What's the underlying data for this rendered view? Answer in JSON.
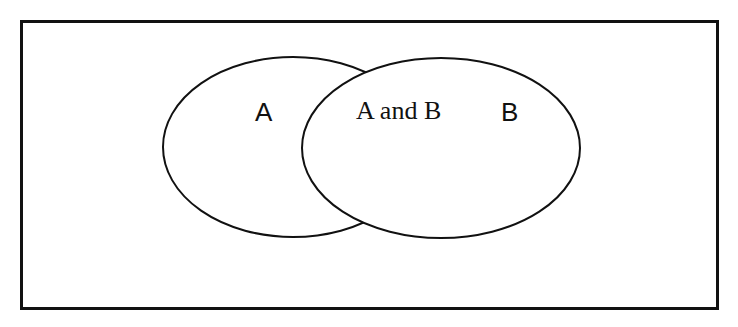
{
  "diagram": {
    "type": "venn",
    "universe": {
      "label": ""
    },
    "sets": [
      {
        "name": "A",
        "label": "A"
      },
      {
        "name": "B",
        "label": "B"
      }
    ],
    "intersection": {
      "label": "A and B"
    }
  },
  "colors": {
    "stroke": "#111111",
    "fill": "#ffffff",
    "background": "#ffffff"
  }
}
